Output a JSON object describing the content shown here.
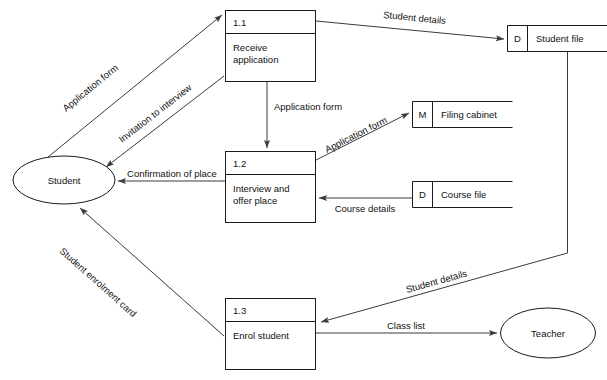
{
  "diagram": {
    "type": "data-flow-diagram",
    "colors": {
      "background": "#ffffff",
      "stroke": "#1a1a1a",
      "flow_stroke": "#3a3a3a",
      "text": "#111111"
    },
    "external_entities": [
      {
        "id": "student",
        "label": "Student",
        "shape": "ellipse"
      },
      {
        "id": "teacher",
        "label": "Teacher",
        "shape": "ellipse"
      }
    ],
    "processes": [
      {
        "id": "p11",
        "number": "1.1",
        "line1": "Receive",
        "line2": "application"
      },
      {
        "id": "p12",
        "number": "1.2",
        "line1": "Interview and",
        "line2": "offer place"
      },
      {
        "id": "p13",
        "number": "1.3",
        "line1": "Enrol student",
        "line2": ""
      }
    ],
    "data_stores": [
      {
        "id": "d_student_file",
        "code": "D",
        "label": "Student file"
      },
      {
        "id": "m_filing_cabinet",
        "code": "M",
        "label": "Filing cabinet"
      },
      {
        "id": "d_course_file",
        "code": "D",
        "label": "Course file"
      }
    ],
    "flows": [
      {
        "id": "f1",
        "label": "Application form",
        "from": "student",
        "to": "p11"
      },
      {
        "id": "f2",
        "label": "Invitation to interview",
        "from": "p11",
        "to": "student"
      },
      {
        "id": "f3",
        "label": "Student details",
        "from": "p11",
        "to": "d_student_file"
      },
      {
        "id": "f4",
        "label": "Application form",
        "from": "p11",
        "to": "p12"
      },
      {
        "id": "f5",
        "label": "Application form",
        "from": "p12",
        "to": "m_filing_cabinet"
      },
      {
        "id": "f6",
        "label": "Confirmation of place",
        "from": "p12",
        "to": "student"
      },
      {
        "id": "f7",
        "label": "Course details",
        "from": "d_course_file",
        "to": "p12"
      },
      {
        "id": "f8",
        "label": "Student enrolment card",
        "from": "p13",
        "to": "student"
      },
      {
        "id": "f9",
        "label": "Student details",
        "from": "d_student_file",
        "to": "p13"
      },
      {
        "id": "f10",
        "label": "Class list",
        "from": "p13",
        "to": "teacher"
      }
    ]
  }
}
